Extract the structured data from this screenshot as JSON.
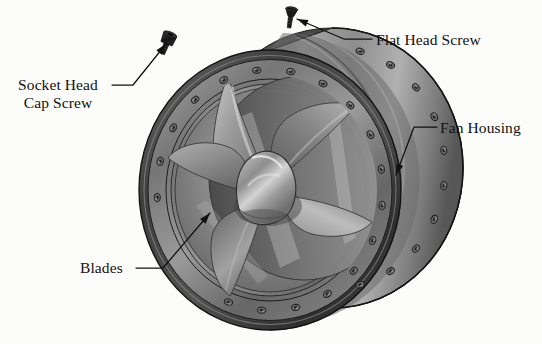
{
  "figure": {
    "kind": "technical-illustration",
    "background_color": "#fcfcfb",
    "line_color": "#111111",
    "text_color": "#111111"
  },
  "callouts": [
    {
      "id": "socket-head-cap-screw",
      "label_line_1": "Socket Head",
      "label_line_2": "Cap Screw",
      "label_full": "Socket Head Cap Screw",
      "points_to": "socket-head-cap-screw-part",
      "leader_start": {
        "x": 112,
        "y": 85
      },
      "leader_elbow": {
        "x": 133,
        "y": 85
      },
      "arrow_tip": {
        "x": 166,
        "y": 44
      }
    },
    {
      "id": "flat-head-screw",
      "label_line_1": "Flat Head Screw",
      "label_full": "Flat Head Screw",
      "points_to": "flat-head-screw-part",
      "leader_start": {
        "x": 372,
        "y": 39
      },
      "leader_elbow": {
        "x": 344,
        "y": 39
      },
      "arrow_tip": {
        "x": 297,
        "y": 19
      }
    },
    {
      "id": "fan-housing",
      "label_line_1": "Fan Housing",
      "label_full": "Fan Housing",
      "points_to": "fan-housing-part",
      "leader_start": {
        "x": 437,
        "y": 127
      },
      "leader_elbow": {
        "x": 414,
        "y": 127
      },
      "arrow_tip": {
        "x": 396,
        "y": 175
      }
    },
    {
      "id": "blades",
      "label_line_1": "Blades",
      "label_full": "Blades",
      "points_to": "fan-blade-part",
      "leader_start": {
        "x": 136,
        "y": 268
      },
      "leader_elbow": {
        "x": 163,
        "y": 268
      },
      "arrow_tip": {
        "x": 210,
        "y": 213
      }
    }
  ],
  "parts": {
    "fan_housing": {
      "name": "Fan Housing",
      "description": "Cylindrical duct shroud with front and rear bolted flange rings",
      "front_flange_bolt_count": 18,
      "rear_flange_bolt_count": 18,
      "shell_color": "#8a8a8a",
      "shadow_color": "#3a3a3a"
    },
    "blades": {
      "name": "Blades",
      "description": "Five-blade propeller rotor with twisted aerofoil blades",
      "blade_count": 5,
      "blade_color": "#9b9b9b"
    },
    "hub": {
      "name": "Hub Spinner",
      "description": "Ogive nose cone at rotor centre",
      "color": "#8e8e8e"
    },
    "socket_head_cap_screw": {
      "name": "Socket Head Cap Screw",
      "description": "Detached fastener shown above the assembly",
      "color": "#1d1d1d"
    },
    "flat_head_screw": {
      "name": "Flat Head Screw",
      "description": "Detached countersunk fastener shown at top of the figure",
      "color": "#1d1d1d"
    }
  },
  "geometry": {
    "fan_center": {
      "x": 270,
      "y": 190
    },
    "fan_front_ring_rx": 131,
    "fan_front_ring_ry": 140,
    "duct_depth_x": 62,
    "duct_depth_y": -22
  }
}
